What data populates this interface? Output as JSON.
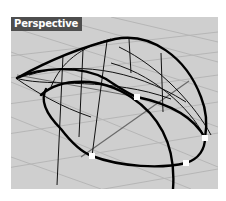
{
  "viewport": {
    "label": "Perspective",
    "background": "#cfcfcf",
    "grid_color": "#b4b4b4",
    "curve_color": "#000000",
    "control_points": [
      {
        "x": 126,
        "y": 80
      },
      {
        "x": 194,
        "y": 121
      },
      {
        "x": 175,
        "y": 146
      },
      {
        "x": 81,
        "y": 139
      }
    ]
  }
}
